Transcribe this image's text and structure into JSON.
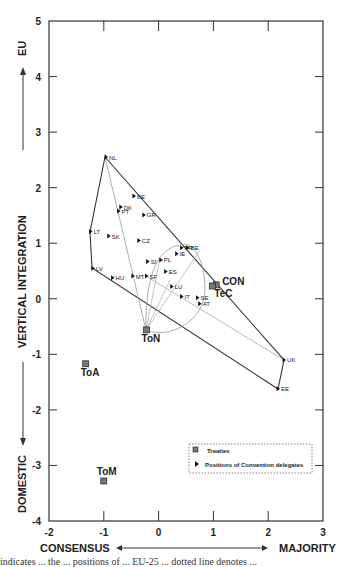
{
  "chart_data": {
    "type": "scatter",
    "title": "",
    "xlabel_left": "CONSENSUS",
    "xlabel_right": "MAJORITY",
    "ylabel_top": "EU",
    "ylabel_middle": "VERTICAL INTEGRATION",
    "ylabel_bottom": "DOMESTIC",
    "xlim": [
      -2,
      3
    ],
    "ylim": [
      -4,
      5
    ],
    "x_ticks": [
      "-2",
      "-1",
      "0",
      "1",
      "2",
      "3"
    ],
    "y_ticks": [
      "5",
      "4",
      "3",
      "2",
      "1",
      "0",
      "-1",
      "-2",
      "-3",
      "-4"
    ],
    "grid": false,
    "legend": {
      "position": "lower right",
      "entries": [
        {
          "marker": "square",
          "label": "Treaties"
        },
        {
          "marker": "triangle",
          "label": "Positions of Convention delegates"
        }
      ]
    },
    "series": [
      {
        "name": "Treaties",
        "marker": "square",
        "points": [
          {
            "label": "ToN",
            "x": -0.22,
            "y": -0.56
          },
          {
            "label": "ToA",
            "x": -1.33,
            "y": -1.17
          },
          {
            "label": "ToM",
            "x": -1.0,
            "y": -3.28
          },
          {
            "label": "CON",
            "x": 1.05,
            "y": 0.25
          },
          {
            "label": "TeC",
            "x": 0.98,
            "y": 0.23
          }
        ]
      },
      {
        "name": "Positions of Convention delegates",
        "marker": "triangle",
        "points": [
          {
            "label": "NL",
            "x": -0.96,
            "y": 2.55
          },
          {
            "label": "BE",
            "x": -0.45,
            "y": 1.85
          },
          {
            "label": "DK",
            "x": -0.69,
            "y": 1.65
          },
          {
            "label": "PT",
            "x": -0.73,
            "y": 1.58
          },
          {
            "label": "GR",
            "x": -0.27,
            "y": 1.51
          },
          {
            "label": "LT",
            "x": -1.24,
            "y": 1.21
          },
          {
            "label": "SK",
            "x": -0.91,
            "y": 1.13
          },
          {
            "label": "CZ",
            "x": -0.36,
            "y": 1.05
          },
          {
            "label": "LV",
            "x": -1.2,
            "y": 0.55
          },
          {
            "label": "HU",
            "x": -0.84,
            "y": 0.38
          },
          {
            "label": "MT",
            "x": -0.47,
            "y": 0.41
          },
          {
            "label": "SF",
            "x": -0.22,
            "y": 0.41
          },
          {
            "label": "SI",
            "x": -0.2,
            "y": 0.67
          },
          {
            "label": "PL",
            "x": 0.04,
            "y": 0.7
          },
          {
            "label": "ES",
            "x": 0.13,
            "y": 0.49
          },
          {
            "label": "IE",
            "x": 0.33,
            "y": 0.81
          },
          {
            "label": "FR",
            "x": 0.42,
            "y": 0.92
          },
          {
            "label": "BE",
            "x": 0.53,
            "y": 0.92
          },
          {
            "label": "LU",
            "x": 0.24,
            "y": 0.22
          },
          {
            "label": "IT",
            "x": 0.42,
            "y": 0.04
          },
          {
            "label": "SE",
            "x": 0.71,
            "y": 0.02
          },
          {
            "label": "AT",
            "x": 0.75,
            "y": -0.09
          },
          {
            "label": "UK",
            "x": 2.29,
            "y": -1.1
          },
          {
            "label": "EE",
            "x": 2.18,
            "y": -1.62
          }
        ]
      }
    ],
    "annotations": [
      {
        "type": "convex-hull",
        "style": "solid",
        "vertices": [
          "NL",
          "UK",
          "EE",
          "LV",
          "LT"
        ]
      },
      {
        "type": "win-set-lines",
        "style": "thin-gray",
        "from": "NL/ToN",
        "to": "UK"
      },
      {
        "type": "circle",
        "style": "thin-gray",
        "center_near": "LU",
        "description": "yolk circle around ToN"
      }
    ]
  },
  "caption": "indicates ... the ... positions of ... EU-25 ... dotted line denotes ..."
}
